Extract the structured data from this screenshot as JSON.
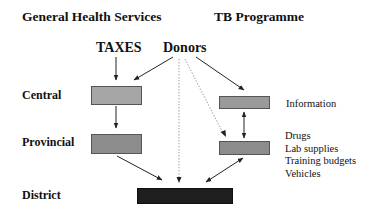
{
  "headers": {
    "general": "General Health Services",
    "tb": "TB Programme"
  },
  "sources": {
    "taxes": "TAXES",
    "donors": "Donors"
  },
  "levels": {
    "central": "Central",
    "provincial": "Provincial",
    "district": "District"
  },
  "tb_notes": {
    "information": "Information",
    "resources": [
      "Drugs",
      "Lab supplies",
      "Training budgets",
      "Vehicles"
    ]
  },
  "colors": {
    "central_box": "#a6a6a6",
    "provincial_box": "#8c8c8c",
    "tb_box": "#9a9a9a",
    "district_box": "#1e1e1e",
    "arrow": "#222222"
  }
}
